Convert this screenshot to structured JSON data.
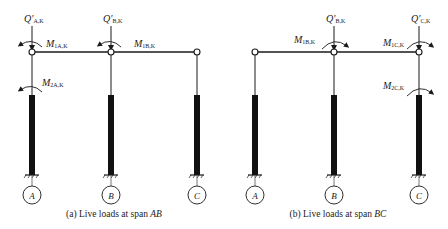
{
  "panels": [
    {
      "id": "a",
      "caption_prefix": "(a) Live loads at span ",
      "caption_span": "AB",
      "nodes": [
        {
          "axis": "A",
          "x": 32
        },
        {
          "axis": "B",
          "x": 111
        },
        {
          "axis": "C",
          "x": 197
        }
      ],
      "shear_labels": [
        {
          "main": "Q'",
          "sub": "A,K",
          "x": 32
        },
        {
          "main": "Q'",
          "sub": "B,K",
          "x": 111
        }
      ],
      "moment_labels": [
        {
          "main": "M",
          "sub": "1A,K",
          "text_x": 46,
          "text_y": 47
        },
        {
          "main": "M",
          "sub": "1B,K",
          "text_x": 135,
          "text_y": 47
        },
        {
          "main": "M",
          "sub": "2A,K",
          "text_x": 42,
          "text_y": 85
        }
      ]
    },
    {
      "id": "b",
      "caption_prefix": "(b) Live loads at span ",
      "caption_span": "BC",
      "nodes": [
        {
          "axis": "A",
          "x": 255
        },
        {
          "axis": "B",
          "x": 334
        },
        {
          "axis": "C",
          "x": 419
        }
      ],
      "shear_labels": [
        {
          "main": "Q'",
          "sub": "B,K",
          "x": 334
        },
        {
          "main": "Q'",
          "sub": "C,K",
          "x": 419
        }
      ],
      "moment_labels": [
        {
          "main": "M",
          "sub": "1B,K",
          "text_x": 294,
          "text_y": 43
        },
        {
          "main": "M",
          "sub": "1C,K",
          "text_x": 383,
          "text_y": 47
        },
        {
          "main": "M",
          "sub": "2C,K",
          "text_x": 383,
          "text_y": 90
        }
      ]
    }
  ],
  "colors": {
    "line": "#1a1a1a",
    "column_fill": "#111111"
  }
}
